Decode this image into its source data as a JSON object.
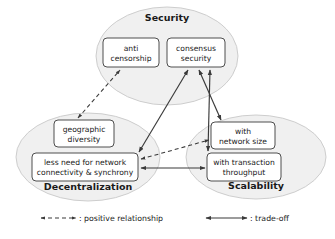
{
  "figure": {
    "background_color": "#ffffff",
    "ellipse_fill": "#f0f0f0",
    "ellipse_stroke": "#c8c8c8",
    "box_fill": "#ffffff",
    "box_stroke": "#3a3a3a",
    "edge_color": "#3a3a3a"
  },
  "groups": [
    {
      "id": "security",
      "label": "Security",
      "label_x": 167,
      "label_y": 21,
      "cx": 167,
      "cy": 56,
      "rx": 71,
      "ry": 49
    },
    {
      "id": "decentralization",
      "label": "Decentralization",
      "label_x": 88,
      "label_y": 190,
      "cx": 88,
      "cy": 157,
      "rx": 72,
      "ry": 44
    },
    {
      "id": "scalability",
      "label": "Scalability",
      "label_x": 256,
      "label_y": 189,
      "cx": 256,
      "cy": 157,
      "rx": 70,
      "ry": 42
    }
  ],
  "nodes": [
    {
      "id": "anti-censorship",
      "group": "security",
      "line1": "anti",
      "line2": "censorship",
      "x": 103,
      "y": 38,
      "w": 56,
      "h": 29
    },
    {
      "id": "consensus-security",
      "group": "security",
      "line1": "consensus",
      "line2": "security",
      "x": 167,
      "y": 38,
      "w": 58,
      "h": 29
    },
    {
      "id": "geographic-diversity",
      "group": "decentralization",
      "line1": "geographic",
      "line2": "diversity",
      "x": 54,
      "y": 120,
      "w": 60,
      "h": 27
    },
    {
      "id": "less-need-network",
      "group": "decentralization",
      "line1": "less need for network",
      "line2": "connectivity & synchrony",
      "x": 32,
      "y": 153,
      "w": 106,
      "h": 28
    },
    {
      "id": "with-network-size",
      "group": "scalability",
      "line1": "with",
      "line2": "network size",
      "x": 211,
      "y": 122,
      "w": 64,
      "h": 27
    },
    {
      "id": "with-transaction-throughput",
      "group": "scalability",
      "line1": "with transaction",
      "line2": "throughput",
      "x": 207,
      "y": 153,
      "w": 74,
      "h": 28
    }
  ],
  "edges": [
    {
      "id": "geographic-diversity-to-anti-censorship",
      "from": "geographic-diversity",
      "to": "anti-censorship",
      "style": "dashed",
      "relationship": "positive relationship"
    },
    {
      "id": "less-need-network-to-with-network-size",
      "from": "less-need-network",
      "to": "with-network-size",
      "style": "dashed",
      "relationship": "positive relationship"
    },
    {
      "id": "less-need-network-to-consensus-security",
      "from": "less-need-network",
      "to": "consensus-security",
      "style": "solid",
      "relationship": "trade-off"
    },
    {
      "id": "consensus-security-to-with-network-size",
      "from": "consensus-security",
      "to": "with-network-size",
      "style": "solid",
      "relationship": "trade-off"
    },
    {
      "id": "consensus-security-to-with-transaction-throughput",
      "from": "consensus-security",
      "to": "with-transaction-throughput",
      "style": "solid",
      "relationship": "trade-off"
    },
    {
      "id": "less-need-network-to-with-transaction-throughput",
      "from": "less-need-network",
      "to": "with-transaction-throughput",
      "style": "solid",
      "relationship": "trade-off"
    }
  ],
  "legend": {
    "items": [
      {
        "id": "positive-relationship",
        "style": "dashed",
        "label": ": positive relationship",
        "label_x": 80,
        "label_y": 221
      },
      {
        "id": "trade-off",
        "style": "solid",
        "label": ": trade-off",
        "label_x": 251,
        "label_y": 221
      }
    ]
  }
}
